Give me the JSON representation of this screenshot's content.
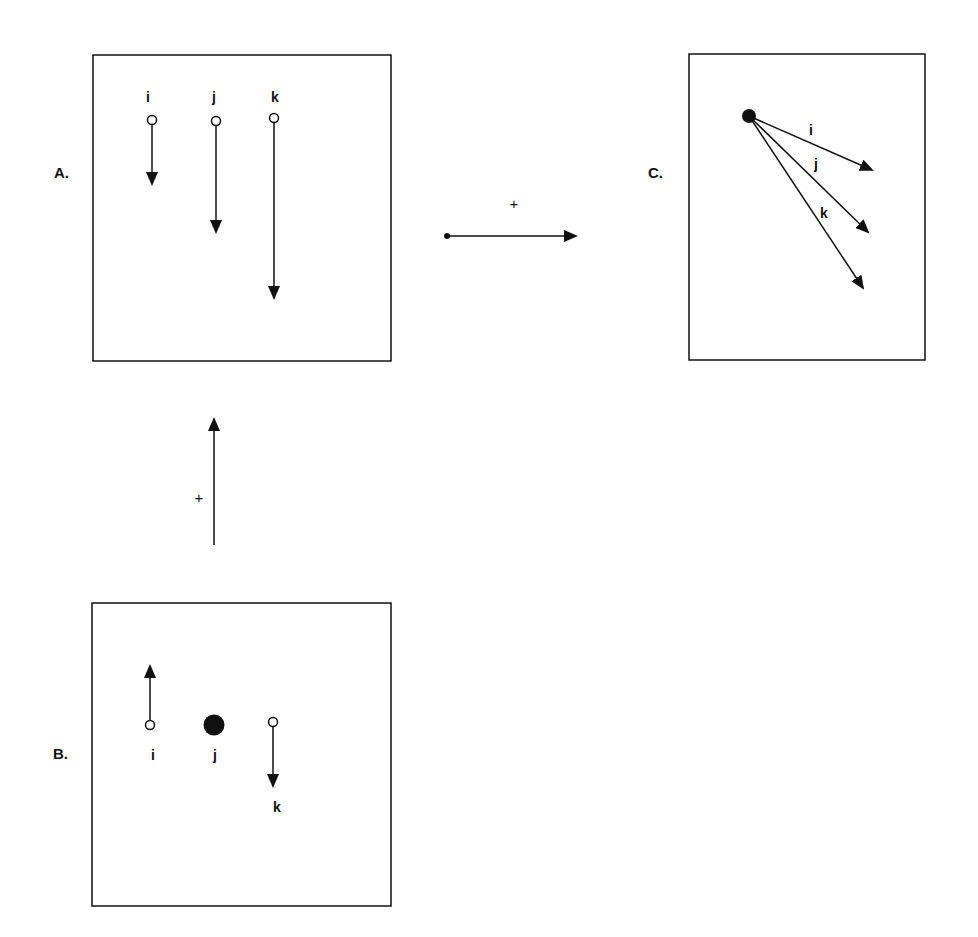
{
  "panels": {
    "A": {
      "label": "A.",
      "points": [
        {
          "name": "i",
          "label": "i"
        },
        {
          "name": "j",
          "label": "j"
        },
        {
          "name": "k",
          "label": "k"
        }
      ]
    },
    "B": {
      "label": "B.",
      "points": [
        {
          "name": "i",
          "label": "i"
        },
        {
          "name": "j",
          "label": "j"
        },
        {
          "name": "k",
          "label": "k"
        }
      ]
    },
    "C": {
      "label": "C.",
      "vectors": [
        {
          "name": "i",
          "label": "i"
        },
        {
          "name": "j",
          "label": "j"
        },
        {
          "name": "k",
          "label": "k"
        }
      ]
    }
  },
  "connectors": {
    "vertical_sign": "+",
    "horizontal_sign": "+"
  },
  "colors": {
    "stroke": "#111111",
    "background": "#ffffff"
  }
}
